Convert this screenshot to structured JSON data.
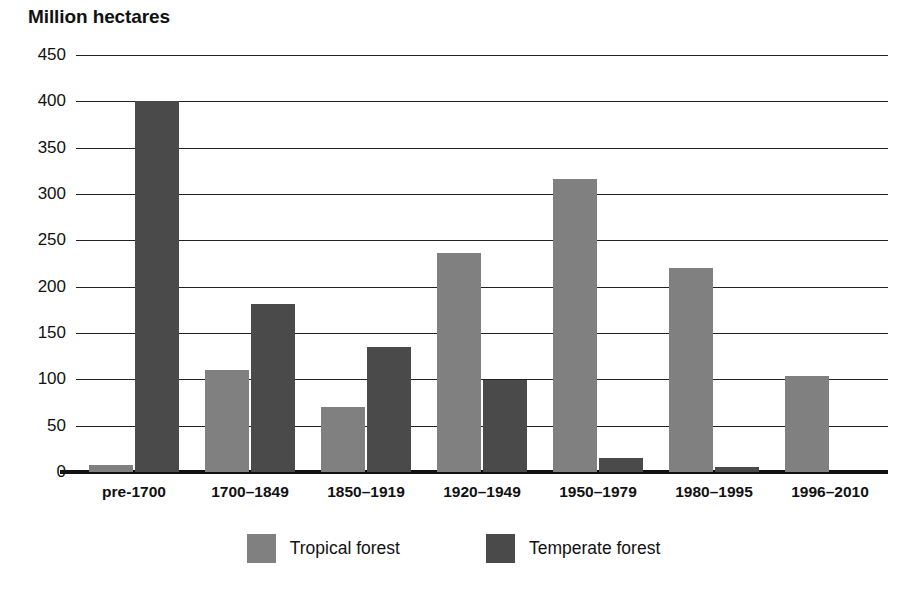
{
  "chart_data": {
    "type": "bar",
    "title": "Million hectares",
    "xlabel": "",
    "ylabel": "Million hectares",
    "ylim": [
      0,
      450
    ],
    "ytick_step": 50,
    "yticks": [
      450,
      400,
      350,
      300,
      250,
      200,
      150,
      100,
      50,
      0
    ],
    "grid": true,
    "grid_axis": "y",
    "legend_position": "bottom-center",
    "categories": [
      "pre-1700",
      "1700–1849",
      "1850–1919",
      "1920–1949",
      "1950–1979",
      "1980–1995",
      "1996–2010"
    ],
    "series": [
      {
        "name": "Tropical forest",
        "color": "#808080",
        "values": [
          8,
          110,
          70,
          236,
          316,
          220,
          104
        ]
      },
      {
        "name": "Temperate forest",
        "color": "#4a4a4a",
        "values": [
          400,
          181,
          135,
          99,
          15,
          5,
          0
        ]
      }
    ]
  },
  "legend": {
    "entries": [
      {
        "label": "Tropical forest",
        "color": "#808080"
      },
      {
        "label": "Temperate forest",
        "color": "#4a4a4a"
      }
    ]
  },
  "colors": {
    "tropical": "#808080",
    "temperate": "#4a4a4a",
    "axis": "#111111",
    "gridline": "#222222",
    "background": "#ffffff"
  }
}
